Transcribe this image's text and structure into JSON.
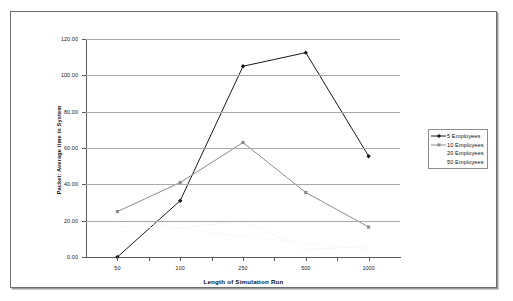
{
  "chart_data": {
    "type": "line",
    "title": "",
    "xlabel": "Length of Simulation Run",
    "ylabel": "Packet: Average time in System",
    "categories": [
      "50",
      "100",
      "250",
      "500",
      "1000"
    ],
    "x_tick_labels": [
      "50",
      "100",
      "250",
      "500",
      "1000"
    ],
    "y_tick_labels": [
      "0.00",
      "20.00",
      "40.00",
      "60.00",
      "80.00",
      "100.00",
      "120.00"
    ],
    "y_ticks": [
      0,
      20,
      40,
      60,
      80,
      100,
      120
    ],
    "ylim": [
      0,
      120
    ],
    "grid": "horizontal",
    "legend_position": "right",
    "series": [
      {
        "name": "5 Employees",
        "values": [
          0,
          31,
          105,
          112.5,
          55.5
        ],
        "color": "#1a1a1a",
        "marker": "diamond"
      },
      {
        "name": "10 Employees",
        "values": [
          25,
          41,
          63,
          35.5,
          16.5
        ],
        "color": "#8c8c8c",
        "marker": "square"
      },
      {
        "name": "20 Employees",
        "values": [
          21,
          16,
          20,
          4,
          6
        ],
        "color": "#f4f4f4",
        "marker": "none"
      },
      {
        "name": "50 Employees",
        "values": [
          17,
          15.5,
          11.5,
          7.5,
          4.5
        ],
        "color": "#f7f7f7",
        "marker": "none"
      }
    ]
  },
  "legend": {
    "entries": [
      {
        "label": "5 Employees"
      },
      {
        "label": "10 Employees"
      },
      {
        "label": "20 Employees"
      },
      {
        "label": "50 Employees"
      }
    ]
  },
  "axes": {
    "y_title": "Packet: Average time in System",
    "x_title": "Length of Simulation Run"
  }
}
